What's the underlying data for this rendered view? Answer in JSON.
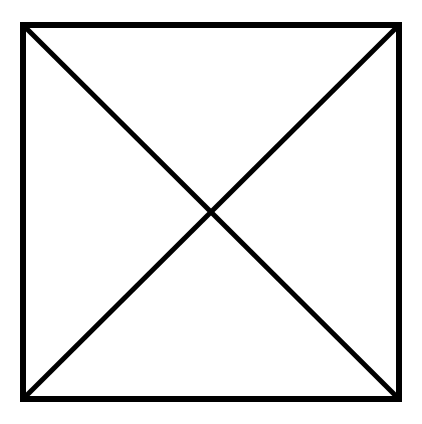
{
  "diagram": {
    "type": "square-with-diagonals",
    "stroke_color": "#000000",
    "background": "#ffffff",
    "square": {
      "x": 23,
      "y": 25,
      "width": 376,
      "height": 374
    },
    "stroke_width": 6
  }
}
